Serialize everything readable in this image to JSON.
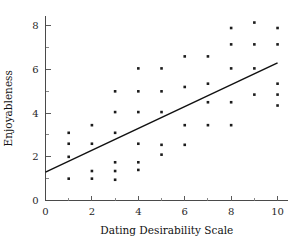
{
  "chart_data": {
    "type": "scatter",
    "title": "",
    "xlabel": "Dating Desirability Scale",
    "ylabel": "Enjoyableness",
    "xlim": [
      0,
      10.45
    ],
    "ylim": [
      0,
      8.45
    ],
    "grid": false,
    "legend": null,
    "x_ticks_major": [
      0,
      2,
      4,
      6,
      8,
      10
    ],
    "x_ticks_minor": [
      1,
      3,
      5,
      7,
      9
    ],
    "y_ticks_major": [
      0,
      2,
      4,
      6,
      8
    ],
    "y_ticks_minor": [
      1,
      3,
      5,
      7
    ],
    "x_tick_labels": [
      "0",
      "2",
      "4",
      "6",
      "8",
      "10"
    ],
    "y_tick_labels": [
      "0",
      "2",
      "4",
      "6",
      "8"
    ],
    "points": [
      {
        "x": 1,
        "y": 1.0
      },
      {
        "x": 1,
        "y": 2.0
      },
      {
        "x": 1,
        "y": 2.6
      },
      {
        "x": 1,
        "y": 3.1
      },
      {
        "x": 2,
        "y": 1.0
      },
      {
        "x": 2,
        "y": 1.35
      },
      {
        "x": 2,
        "y": 2.6
      },
      {
        "x": 2,
        "y": 3.45
      },
      {
        "x": 3,
        "y": 0.95
      },
      {
        "x": 3,
        "y": 1.35
      },
      {
        "x": 3,
        "y": 1.75
      },
      {
        "x": 3,
        "y": 3.1
      },
      {
        "x": 3,
        "y": 4.05
      },
      {
        "x": 3,
        "y": 5.0
      },
      {
        "x": 4,
        "y": 1.4
      },
      {
        "x": 4,
        "y": 1.75
      },
      {
        "x": 4,
        "y": 2.6
      },
      {
        "x": 4,
        "y": 4.05
      },
      {
        "x": 4,
        "y": 5.0
      },
      {
        "x": 4,
        "y": 6.05
      },
      {
        "x": 5,
        "y": 2.1
      },
      {
        "x": 5,
        "y": 2.55
      },
      {
        "x": 5,
        "y": 4.05
      },
      {
        "x": 5,
        "y": 5.0
      },
      {
        "x": 5,
        "y": 6.05
      },
      {
        "x": 6,
        "y": 2.55
      },
      {
        "x": 6,
        "y": 3.45
      },
      {
        "x": 6,
        "y": 5.2
      },
      {
        "x": 6,
        "y": 6.6
      },
      {
        "x": 7,
        "y": 3.45
      },
      {
        "x": 7,
        "y": 4.5
      },
      {
        "x": 7,
        "y": 5.35
      },
      {
        "x": 7,
        "y": 6.6
      },
      {
        "x": 8,
        "y": 3.45
      },
      {
        "x": 8,
        "y": 4.5
      },
      {
        "x": 8,
        "y": 6.05
      },
      {
        "x": 8,
        "y": 7.15
      },
      {
        "x": 8,
        "y": 7.9
      },
      {
        "x": 9,
        "y": 4.85
      },
      {
        "x": 9,
        "y": 6.05
      },
      {
        "x": 9,
        "y": 7.15
      },
      {
        "x": 9,
        "y": 8.15
      },
      {
        "x": 10,
        "y": 4.35
      },
      {
        "x": 10,
        "y": 4.85
      },
      {
        "x": 10,
        "y": 5.35
      },
      {
        "x": 10,
        "y": 7.15
      },
      {
        "x": 10,
        "y": 7.9
      }
    ],
    "fit_line": {
      "name": "regression-line",
      "x_start": 0,
      "y_start": 1.3,
      "x_end": 10,
      "y_end": 6.3
    },
    "marker": {
      "shape": "square",
      "size_px": 2.6,
      "color": "#1c1c1c"
    },
    "colors": {
      "axis": "#4a4a4a",
      "text": "#111111",
      "point": "#1c1c1c",
      "line": "#111111",
      "background": "#ffffff"
    }
  }
}
